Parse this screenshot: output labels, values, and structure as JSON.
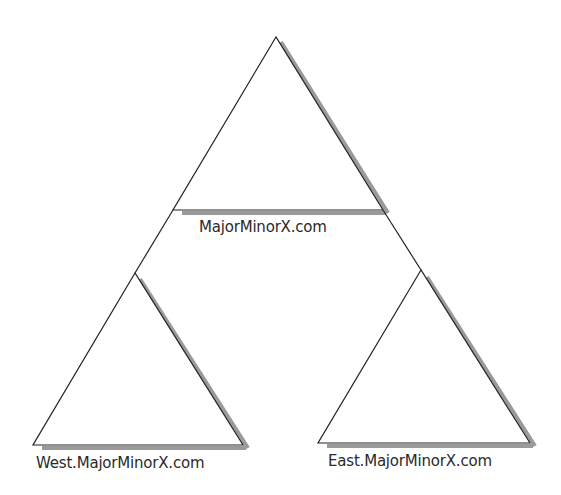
{
  "diagram": {
    "type": "domain-tree",
    "colors": {
      "stroke": "#222222",
      "shadow": "#999999",
      "background": "#ffffff",
      "text": "#2a2a2a"
    },
    "nodes": [
      {
        "id": "root",
        "label": "MajorMinorX.com",
        "shape": "triangle",
        "apex": [
          276,
          37
        ],
        "base_left": [
          173,
          210
        ],
        "base_right": [
          383,
          210
        ]
      },
      {
        "id": "west",
        "label": "West.MajorMinorX.com",
        "shape": "triangle",
        "apex": [
          135,
          273
        ],
        "base_left": [
          33,
          445
        ],
        "base_right": [
          243,
          445
        ]
      },
      {
        "id": "east",
        "label": "East.MajorMinorX.com",
        "shape": "triangle",
        "apex": [
          421,
          270
        ],
        "base_left": [
          318,
          443
        ],
        "base_right": [
          530,
          443
        ]
      }
    ],
    "edges": [
      {
        "from": "root",
        "to": "west"
      },
      {
        "from": "root",
        "to": "east"
      }
    ]
  }
}
